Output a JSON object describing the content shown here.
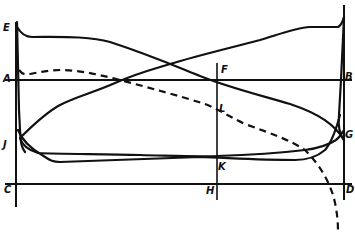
{
  "diagram": {
    "type": "indicator-diagram",
    "labels": {
      "E": "E",
      "A": "A",
      "J": "J",
      "C": "C",
      "F": "F",
      "L": "L",
      "K": "K",
      "H": "H",
      "B": "B",
      "G": "G",
      "D": "D"
    },
    "lines": [
      {
        "name": "AB",
        "kind": "horizontal reference line"
      },
      {
        "name": "CD",
        "kind": "horizontal baseline"
      },
      {
        "name": "FH",
        "kind": "vertical mid-stroke line"
      },
      {
        "name": "left-ordinate",
        "kind": "vertical line through E, A, J, C"
      },
      {
        "name": "right-ordinate",
        "kind": "vertical line through B, G, D"
      }
    ],
    "curves": [
      {
        "name": "curve-E-to-G",
        "style": "solid",
        "description": "starts high at E, falls across to G"
      },
      {
        "name": "curve-J-to-top-right",
        "style": "solid",
        "description": "rises from J to top right corner"
      },
      {
        "name": "dashed-curve-A-L-D",
        "style": "dashed",
        "description": "from A through L, dropping below D"
      },
      {
        "name": "bottom-loop",
        "style": "solid",
        "description": "lower loop between J and G crossing near K"
      }
    ],
    "colors": {
      "ink": "#111111",
      "background": "#ffffff"
    }
  }
}
